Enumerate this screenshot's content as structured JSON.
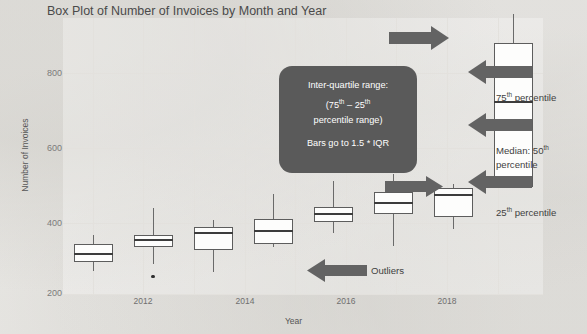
{
  "chart_data": {
    "type": "box",
    "title": "Box Plot of Number of Invoices by Month and Year",
    "xlabel": "Year",
    "ylabel": "Number of Invoices",
    "ylim": [
      190,
      860
    ],
    "yticks": [
      200,
      400,
      600,
      800
    ],
    "xticks": [
      "2012",
      "2014",
      "2016",
      "2018"
    ],
    "grid": true,
    "legend": "none",
    "categories": [
      "2011",
      "2012",
      "2013",
      "2014",
      "2015",
      "2016",
      "2017",
      "2018"
    ],
    "boxes": [
      {
        "year": "2011",
        "whisker_low": 245,
        "q1": 268,
        "median": 288,
        "q3": 311,
        "whisker_high": 333,
        "outliers": []
      },
      {
        "year": "2012",
        "whisker_low": 262,
        "q1": 305,
        "median": 320,
        "q3": 334,
        "whisker_high": 398,
        "outliers": [
          232
        ]
      },
      {
        "year": "2013",
        "whisker_low": 243,
        "q1": 297,
        "median": 339,
        "q3": 352,
        "whisker_high": 370,
        "outliers": []
      },
      {
        "year": "2014",
        "whisker_low": 305,
        "q1": 312,
        "median": 344,
        "q3": 373,
        "whisker_high": 433,
        "outliers": []
      },
      {
        "year": "2015",
        "whisker_low": 337,
        "q1": 364,
        "median": 383,
        "q3": 400,
        "whisker_high": 464,
        "outliers": [
          253
        ]
      },
      {
        "year": "2016",
        "whisker_low": 306,
        "q1": 383,
        "median": 412,
        "q3": 437,
        "whisker_high": 482,
        "outliers": []
      },
      {
        "year": "2017",
        "whisker_low": 347,
        "q1": 377,
        "median": 430,
        "q3": 447,
        "whisker_high": 457,
        "outliers": []
      },
      {
        "year": "2018",
        "whisker_low": 452,
        "q1": 450,
        "median": 655,
        "q3": 800,
        "whisker_high": 870,
        "outliers": []
      }
    ]
  },
  "callout": {
    "line1": "Inter-quartile range:",
    "line2_pre": "(75",
    "line2_sup1": "th",
    "line2_mid": " – 25",
    "line2_sup2": "th",
    "line3": "percentile range)",
    "line4": "Bars go to 1.5 * IQR"
  },
  "annotations": {
    "p75_pre": "75",
    "p75_sup": "th",
    "p75_post": " percentile",
    "median_pre": "Median:  50",
    "median_sup": "th",
    "median_post": "percentile",
    "p25_pre": "25",
    "p25_sup": "th",
    "p25_post": " percentile",
    "outliers": "Outliers"
  },
  "colors": {
    "arrow": "#636363",
    "callout_bg": "#5a5a5a",
    "box_stroke": "#5d5d5d",
    "grid": "#e3e1dd",
    "page_bg": "#f2f1ef"
  }
}
